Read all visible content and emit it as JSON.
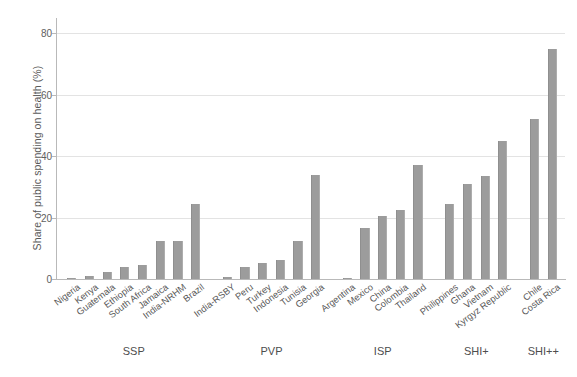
{
  "chart_data": {
    "type": "bar",
    "title": "",
    "xlabel": "",
    "ylabel": "Share of public spending on health (%)",
    "ylim": [
      0,
      85
    ],
    "yticks": [
      0,
      20,
      40,
      60,
      80
    ],
    "ytick_labels": [
      "0",
      "20",
      "40",
      "60",
      "80"
    ],
    "grid": true,
    "legend": false,
    "bar_color": "#9c9c9c",
    "axis_color": "#b9b9b9",
    "grid_color": "#e3e3e3",
    "categories": [
      "Nigeria",
      "Kenya",
      "Guatemala",
      "Ethiopia",
      "South Africa",
      "Jamaica",
      "India-NRHM",
      "Brazil",
      "India-RSBY",
      "Peru",
      "Turkey",
      "Indonesia",
      "Tunisia",
      "Georgia",
      "Argentina",
      "Mexico",
      "China",
      "Colombia",
      "Thailand",
      "Philippines",
      "Ghana",
      "Vietnam",
      "Kyrgyz Republic",
      "Chile",
      "Costa Rica"
    ],
    "values": [
      0.2,
      1.1,
      2.4,
      4.0,
      4.7,
      12.5,
      12.5,
      24.5,
      0.5,
      4.0,
      5.2,
      6.3,
      12.5,
      34.0,
      0.4,
      16.5,
      20.5,
      22.5,
      37.0,
      24.5,
      31.0,
      33.5,
      45.0,
      52.0,
      75.0
    ],
    "groups": [
      {
        "label": "SSP",
        "count": 8
      },
      {
        "label": "PVP",
        "count": 6
      },
      {
        "label": "ISP",
        "count": 5
      },
      {
        "label": "SHI+",
        "count": 4
      },
      {
        "label": "SHI++",
        "count": 2
      }
    ]
  }
}
